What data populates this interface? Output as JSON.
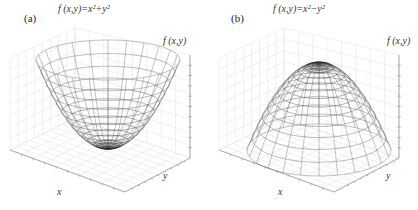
{
  "figure": {
    "background": "#ffffff",
    "wire_color": "#555555",
    "grid_color": "#e2e2e2",
    "axis_color": "#888888"
  },
  "panels": [
    {
      "label": "(a)",
      "title": "f (x,y)=x²+y²",
      "zlabel": "f (x,y)",
      "xlabel": "x",
      "ylabel": "y"
    },
    {
      "label": "(b)",
      "title": "f (x,y)=x²−y²",
      "zlabel": "f (x,y)",
      "xlabel": "x",
      "ylabel": "y"
    }
  ],
  "chart_data": [
    {
      "type": "surface",
      "panel": "(a)",
      "title": "f(x,y)=x^2+y^2",
      "surface": "paraboloid",
      "orientation": "opening-upward",
      "xlabel": "x",
      "ylabel": "y",
      "zlabel": "f(x,y)",
      "grid": true,
      "wireframe": true,
      "radial_lines": 24,
      "rings": 14,
      "z_ticks": 9,
      "projection": {
        "cx": 108,
        "bottom_y": 148,
        "top_y": 60,
        "rx": 72,
        "ry_top": 20
      }
    },
    {
      "type": "surface",
      "panel": "(b)",
      "title": "f(x,y)=x^2-y^2",
      "surface": "paraboloid",
      "orientation": "opening-downward",
      "xlabel": "x",
      "ylabel": "y",
      "zlabel": "f(x,y)",
      "grid": true,
      "wireframe": true,
      "radial_lines": 24,
      "rings": 14,
      "z_ticks": 9,
      "projection": {
        "cx": 110,
        "bottom_y": 150,
        "top_y": 64,
        "rx": 72,
        "ry_top": 26
      }
    }
  ]
}
